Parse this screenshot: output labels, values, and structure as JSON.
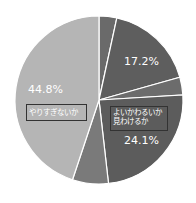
{
  "chart_data": {
    "type": "pie",
    "title": "",
    "center": [
      99,
      100
    ],
    "radius": 84,
    "start_angle_deg": 0,
    "direction": "clockwise",
    "slices": [
      {
        "value": 3.4,
        "label": "",
        "color": "#6a6a6a"
      },
      {
        "value": 17.2,
        "label": "17.2%",
        "color": "#5e5e5e"
      },
      {
        "value": 3.4,
        "label": "",
        "color": "#6c6c6c"
      },
      {
        "value": 24.1,
        "label": "24.1%",
        "color": "#5c5c5c"
      },
      {
        "value": 6.9,
        "label": "",
        "color": "#7a7a7a"
      },
      {
        "value": 44.8,
        "label": "44.8%",
        "color": "#b5b5b5"
      }
    ],
    "annotations": [
      {
        "text": "やりすぎないか",
        "boxed": true
      },
      {
        "text": "よいかわるいか\n見わけるか",
        "boxed": true
      }
    ],
    "separator_color": "#ffffff"
  },
  "labels": {
    "pct_448": "44.8%",
    "pct_172": "17.2%",
    "pct_241": "24.1%",
    "note_left": "やりすぎないか",
    "note_right_line1": "よいかわるいか",
    "note_right_line2": "見わけるか"
  }
}
